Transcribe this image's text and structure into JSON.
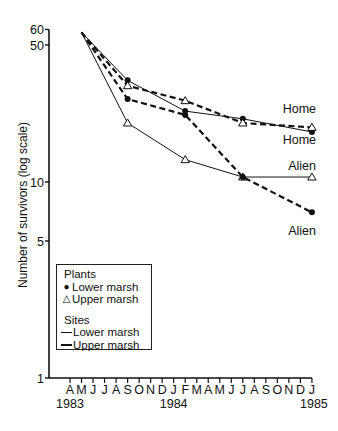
{
  "chart_data": {
    "type": "line",
    "title": "",
    "xlabel": "",
    "ylabel": "Number of survivors (log scale)",
    "yscale": "log",
    "ylim": [
      1,
      60
    ],
    "y_ticks": [
      1,
      5,
      10,
      50,
      60
    ],
    "x_tick_labels": [
      "A",
      "M",
      "J",
      "J",
      "A",
      "S",
      "O",
      "N",
      "D",
      "J",
      "F",
      "M",
      "A",
      "M",
      "J",
      "J",
      "A",
      "S",
      "O",
      "N",
      "D",
      "J"
    ],
    "x_year_labels": [
      {
        "label": "1983",
        "month_index": 0
      },
      {
        "label": "1984",
        "month_index": 9
      },
      {
        "label": "1985",
        "month_index": 21
      }
    ],
    "x_range_months": [
      "Apr 1983",
      "Jan 1985"
    ],
    "grid": false,
    "legend_position": "lower left, inside plot",
    "x_dates": [
      "May 1983",
      "Sep 1983",
      "Feb 1984",
      "Jul 1984",
      "Jan 1985"
    ],
    "x_month_index": [
      1,
      5,
      10,
      15,
      21
    ],
    "series": [
      {
        "name": "Lower marsh plants, lower marsh site (Home)",
        "plant": "Lower marsh",
        "site": "Lower marsh",
        "marker": "dot",
        "line": "solid",
        "end_label": "Home",
        "values": [
          58,
          33,
          23,
          21,
          18
        ]
      },
      {
        "name": "Upper marsh plants, upper marsh site (Home)",
        "plant": "Upper marsh",
        "site": "Upper marsh",
        "marker": "triangle",
        "line": "dashed",
        "end_label": "Home",
        "values": [
          58,
          31,
          26,
          20,
          19
        ]
      },
      {
        "name": "Upper marsh plants, lower marsh site (Alien)",
        "plant": "Upper marsh",
        "site": "Lower marsh",
        "marker": "triangle",
        "line": "solid",
        "end_label": "Alien",
        "values": [
          58,
          20,
          13,
          10.6,
          10.6
        ]
      },
      {
        "name": "Lower marsh plants, upper marsh site (Alien)",
        "plant": "Lower marsh",
        "site": "Upper marsh",
        "marker": "dot",
        "line": "dashed",
        "end_label": "Alien",
        "values": [
          58,
          26.5,
          22,
          10.6,
          7
        ]
      }
    ],
    "end_labels": [
      {
        "text": "Home",
        "y_value": 23.5
      },
      {
        "text": "Home",
        "y_value": 16.3
      },
      {
        "text": "Alien",
        "y_value": 12.0
      },
      {
        "text": "Alien",
        "y_value": 5.6
      }
    ]
  },
  "legend": {
    "plants_title": "Plants",
    "plants": [
      {
        "symbol": "●",
        "label": "Lower marsh"
      },
      {
        "symbol": "△",
        "label": "Upper marsh"
      }
    ],
    "sites_title": "Sites",
    "sites": [
      {
        "line": "solid",
        "label": "Lower marsh"
      },
      {
        "line": "dashed",
        "label": "Upper marsh"
      }
    ]
  },
  "colors": {
    "ink": "#111111",
    "background": "#ffffff"
  }
}
